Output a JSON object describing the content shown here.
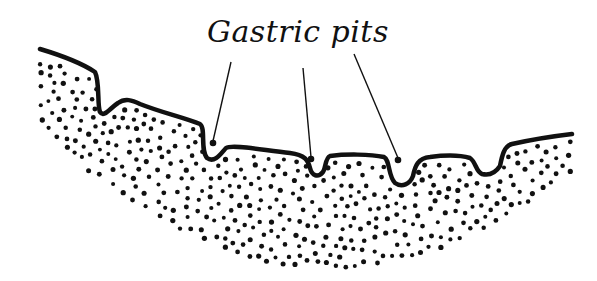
{
  "diagram": {
    "title_label": "Gastric pits",
    "colors": {
      "ink": "#111111",
      "background": "#ffffff"
    },
    "label_position": {
      "x": 207,
      "y": 14
    },
    "surface_path": "M40,49 C60,55 80,62 95,72 C100,82 97,105 100,112 C104,118 110,108 118,103 C125,98 132,100 140,104 C160,112 185,118 200,124 C206,128 200,150 207,158 C215,164 222,152 226,148 C232,144 262,150 290,153 C305,155 308,160 310,168 C312,176 318,178 323,172 C326,168 325,158 330,156 C345,154 370,154 384,157 C390,160 388,176 395,183 C402,188 410,184 413,176 C415,166 418,158 430,157 C445,155 460,155 470,158 C476,162 476,172 482,174 C490,176 496,172 500,166 C502,156 504,146 512,144 C530,140 555,136 572,134",
    "leaders": [
      {
        "name": "leader-pit-1",
        "x1": 231,
        "y1": 62,
        "x2": 213,
        "y2": 141
      },
      {
        "name": "leader-pit-2",
        "x1": 303,
        "y1": 68,
        "x2": 311,
        "y2": 157
      },
      {
        "name": "leader-pit-3",
        "x1": 354,
        "y1": 54,
        "x2": 398,
        "y2": 158
      }
    ],
    "stipple": {
      "region": "lamina propria",
      "dot_radius": 2.3
    }
  }
}
